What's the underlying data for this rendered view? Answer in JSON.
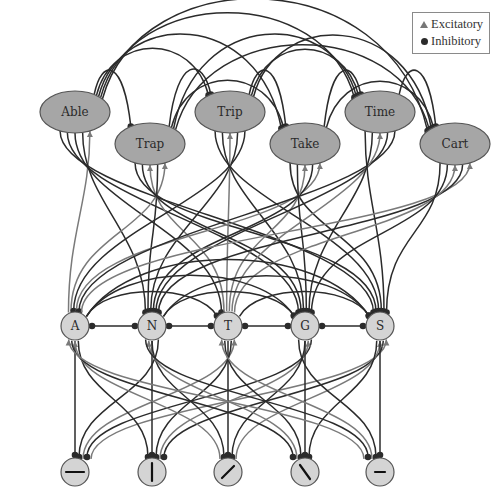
{
  "legend": {
    "excitatory_label": "Excitatory",
    "inhibitory_label": "Inhibitory",
    "excitatory_icon": "triangle-arrowhead-icon",
    "inhibitory_icon": "circle-dot-icon"
  },
  "colors": {
    "word_fill": "#a6a6a6",
    "node_fill": "#d4d4d4",
    "node_stroke": "#555555",
    "excitatory": "#7a7a7a",
    "inhibitory": "#2b2b2b",
    "background": "#ffffff"
  },
  "word_layer": {
    "nodes": [
      {
        "label": "Able",
        "x": 75,
        "y": 112
      },
      {
        "label": "Trap",
        "x": 150,
        "y": 144
      },
      {
        "label": "Trip",
        "x": 230,
        "y": 112
      },
      {
        "label": "Take",
        "x": 305,
        "y": 144
      },
      {
        "label": "Time",
        "x": 380,
        "y": 112
      },
      {
        "label": "Cart",
        "x": 455,
        "y": 144
      }
    ]
  },
  "letter_layer": {
    "nodes": [
      {
        "label": "A",
        "x": 75,
        "y": 326
      },
      {
        "label": "N",
        "x": 152,
        "y": 326
      },
      {
        "label": "T",
        "x": 228,
        "y": 326
      },
      {
        "label": "G",
        "x": 305,
        "y": 326
      },
      {
        "label": "S",
        "x": 380,
        "y": 326
      }
    ]
  },
  "feature_layer": {
    "nodes": [
      {
        "glyph": "horizontal-line",
        "x": 75,
        "y": 472
      },
      {
        "glyph": "vertical-line",
        "x": 152,
        "y": 472
      },
      {
        "glyph": "forward-slash",
        "x": 228,
        "y": 472
      },
      {
        "glyph": "back-slash",
        "x": 305,
        "y": 472
      },
      {
        "glyph": "short-dash",
        "x": 380,
        "y": 472
      }
    ]
  }
}
